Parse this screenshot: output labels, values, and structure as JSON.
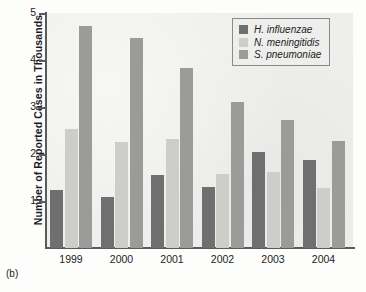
{
  "caption": "(b)",
  "chart_data": {
    "type": "bar",
    "title": "",
    "xlabel": "",
    "ylabel": "Number of Reported Cases in Thousands",
    "categories": [
      "1999",
      "2000",
      "2001",
      "2002",
      "2003",
      "2004"
    ],
    "series": [
      {
        "name": "H. influenzae",
        "color": "#6f6f6f",
        "values": [
          1.23,
          1.08,
          1.55,
          1.29,
          2.05,
          1.88
        ]
      },
      {
        "name": "N. meningitidis",
        "color": "#cdcdca",
        "values": [
          2.54,
          2.26,
          2.31,
          1.57,
          1.61,
          1.28
        ]
      },
      {
        "name": "S. pneumoniae",
        "color": "#9b9b99",
        "values": [
          4.73,
          4.47,
          3.84,
          3.11,
          2.73,
          2.28
        ]
      }
    ],
    "ylim": [
      0,
      5
    ],
    "yticks": [
      "1",
      "2",
      "3",
      "4",
      "5"
    ],
    "ytick_values": [
      1,
      2,
      3,
      4,
      5
    ],
    "grid": false,
    "legend_position": "top-right"
  }
}
